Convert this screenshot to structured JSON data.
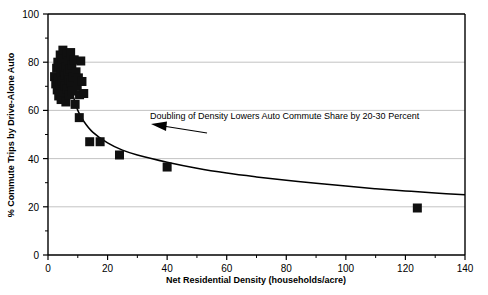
{
  "chart_data": {
    "type": "scatter",
    "title": "",
    "xlabel": "Net Residential Density (households/acre)",
    "ylabel": "% Commute Trips by Drive-Alone Auto",
    "xlim": [
      0,
      140
    ],
    "ylim": [
      0,
      100
    ],
    "xticks": [
      0,
      20,
      40,
      60,
      80,
      100,
      120,
      140
    ],
    "xtick_labels": [
      "0",
      "20",
      "40",
      "60",
      "80",
      "100",
      "120",
      "140"
    ],
    "yticks": [
      0,
      20,
      40,
      60,
      80,
      100
    ],
    "ytick_labels": [
      "0",
      "20",
      "40",
      "60",
      "80",
      "100"
    ],
    "x_minor_tick_interval": 10,
    "y_minor_tick_interval": 10,
    "grid": "horizontal",
    "grid_color": "#b4b4b4",
    "legend": "none",
    "marker": {
      "shape": "square",
      "color": "#101010",
      "size_px": 9
    },
    "series": [
      {
        "name": "Metropolitan areas",
        "points": [
          [
            2.2,
            74.0
          ],
          [
            2.6,
            71.0
          ],
          [
            2.9,
            77.5
          ],
          [
            3.1,
            68.5
          ],
          [
            3.3,
            80.0
          ],
          [
            3.5,
            73.0
          ],
          [
            3.6,
            66.0
          ],
          [
            3.8,
            78.5
          ],
          [
            4.0,
            70.5
          ],
          [
            4.1,
            83.0
          ],
          [
            4.3,
            75.5
          ],
          [
            4.4,
            64.5
          ],
          [
            4.6,
            79.5
          ],
          [
            4.8,
            72.0
          ],
          [
            5.0,
            85.0
          ],
          [
            5.1,
            67.5
          ],
          [
            5.3,
            76.5
          ],
          [
            5.5,
            81.5
          ],
          [
            5.6,
            70.0
          ],
          [
            5.8,
            74.5
          ],
          [
            6.0,
            63.5
          ],
          [
            6.1,
            78.0
          ],
          [
            6.3,
            83.5
          ],
          [
            6.5,
            69.0
          ],
          [
            6.6,
            75.0
          ],
          [
            6.8,
            80.5
          ],
          [
            7.0,
            72.5
          ],
          [
            7.2,
            66.5
          ],
          [
            7.4,
            77.0
          ],
          [
            7.6,
            84.0
          ],
          [
            7.8,
            71.5
          ],
          [
            8.0,
            79.0
          ],
          [
            8.2,
            68.0
          ],
          [
            8.5,
            74.0
          ],
          [
            8.8,
            81.0
          ],
          [
            9.1,
            62.5
          ],
          [
            9.4,
            76.0
          ],
          [
            9.8,
            70.0
          ],
          [
            10.2,
            73.5
          ],
          [
            10.6,
            66.5
          ],
          [
            11.0,
            80.5
          ],
          [
            11.4,
            72.0
          ],
          [
            12.0,
            67.0
          ],
          [
            14.0,
            47.0
          ],
          [
            17.5,
            47.0
          ],
          [
            24.0,
            41.5
          ],
          [
            10.5,
            57.0
          ],
          [
            40.0,
            36.5
          ],
          [
            124.0,
            19.5
          ]
        ]
      }
    ],
    "fit_curve": {
      "name": "Fitted trend",
      "description": "Doubling of density lowers auto commute share by 20-30 percent",
      "points": [
        [
          8.0,
          68.0
        ],
        [
          10.0,
          60.0
        ],
        [
          12.0,
          55.5
        ],
        [
          15.0,
          51.0
        ],
        [
          20.0,
          46.5
        ],
        [
          25.0,
          43.5
        ],
        [
          30.0,
          41.5
        ],
        [
          40.0,
          38.5
        ],
        [
          50.0,
          36.0
        ],
        [
          60.0,
          34.0
        ],
        [
          70.0,
          32.4
        ],
        [
          80.0,
          31.0
        ],
        [
          90.0,
          29.8
        ],
        [
          100.0,
          28.6
        ],
        [
          110.0,
          27.5
        ],
        [
          120.0,
          26.6
        ],
        [
          130.0,
          25.7
        ],
        [
          140.0,
          25.0
        ]
      ]
    },
    "annotations": [
      {
        "id": "doubling-note",
        "text": "Doubling of Density Lowers Auto Commute Share by 20-30 Percent",
        "text_x": 150,
        "text_y": 119,
        "arrow_from_x": 207,
        "arrow_from_y": 133,
        "arrow_to_x": 151,
        "arrow_to_y": 124
      }
    ]
  },
  "figure": {
    "background_color": "#ffffff",
    "axis_color": "#000000",
    "text_color": "#000000"
  }
}
